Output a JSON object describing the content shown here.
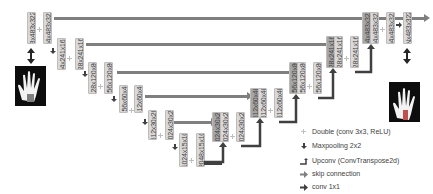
{
  "diagram": {
    "encoder": [
      {
        "id": "e1a",
        "label": "3x483x322"
      },
      {
        "id": "e1b",
        "label": "64x483x322"
      },
      {
        "id": "e2a",
        "label": "64x241x161"
      },
      {
        "id": "e2b",
        "label": "128x241x161"
      },
      {
        "id": "e3a",
        "label": "128x120x80"
      },
      {
        "id": "e3b",
        "label": "256x120x80"
      },
      {
        "id": "e4a",
        "label": "256x60x40"
      },
      {
        "id": "e4b",
        "label": "512x60x40"
      },
      {
        "id": "e5a",
        "label": "512x30x20"
      },
      {
        "id": "e5b",
        "label": "1024x30x20"
      },
      {
        "id": "b1",
        "label": "1024x15x10"
      },
      {
        "id": "b2",
        "label": "2048x15x10"
      }
    ],
    "decoder": [
      {
        "id": "d5cat1",
        "label": "1024x30x20"
      },
      {
        "id": "d5cat2",
        "label": "1024x30x20"
      },
      {
        "id": "d5",
        "label": "1024x30x20"
      },
      {
        "id": "d4cat1",
        "label": "512x60x40"
      },
      {
        "id": "d4cat2",
        "label": "512x60x40"
      },
      {
        "id": "d4",
        "label": "512x60x40"
      },
      {
        "id": "d3cat1",
        "label": "256x120x80"
      },
      {
        "id": "d3cat2",
        "label": "256x120x80"
      },
      {
        "id": "d3",
        "label": "256x120x80"
      },
      {
        "id": "d2cat1",
        "label": "128x241x161"
      },
      {
        "id": "d2cat2",
        "label": "128x241x161"
      },
      {
        "id": "d2",
        "label": "128x241x161"
      },
      {
        "id": "d1cat1",
        "label": "64x483x322"
      },
      {
        "id": "d1cat2",
        "label": "64x483x322"
      },
      {
        "id": "d1",
        "label": "64x483x322"
      },
      {
        "id": "out",
        "label": "Nx483x322"
      }
    ],
    "images": {
      "input": "input-hand-image",
      "output": "output-hand-segmentation"
    },
    "legend": [
      {
        "icon": "double-conv-icon",
        "label": "Double (conv 3x3, ReLU)"
      },
      {
        "icon": "maxpool-icon",
        "label": "Maxpooling 2x2"
      },
      {
        "icon": "upconv-icon",
        "label": "Upconv (ConvTranspose2d)"
      },
      {
        "icon": "skip-connection-icon",
        "label": "skip connection"
      },
      {
        "icon": "conv1x1-icon",
        "label": "conv 1x1"
      }
    ],
    "colors": {
      "block": "#d9d9d9",
      "concat_block": "#a6a6a6",
      "skip_arrow": "#7f7f7f",
      "dark_arrow": "#404040",
      "double_conv": "#bfbfbf"
    }
  }
}
